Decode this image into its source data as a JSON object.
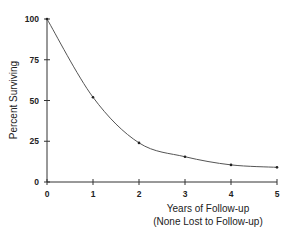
{
  "chart_data": {
    "type": "line",
    "title": "",
    "xlabel": "Years of Follow-up",
    "xlabel_sub": "(None Lost to Follow-up)",
    "ylabel": "Percent Surviving",
    "x_ticks": [
      "0",
      "1",
      "2",
      "3",
      "4",
      "5"
    ],
    "y_ticks": [
      "0",
      "25",
      "50",
      "75",
      "100"
    ],
    "xlim": [
      0,
      5
    ],
    "ylim": [
      0,
      100
    ],
    "grid": false,
    "legend": null,
    "series": [
      {
        "name": "Survival",
        "x": [
          0,
          1,
          2,
          3,
          4,
          5
        ],
        "values": [
          100,
          52,
          24,
          15.5,
          10.5,
          9
        ]
      }
    ],
    "colors": {
      "line": "#555555",
      "axis": "#333333",
      "text": "#222222"
    }
  }
}
